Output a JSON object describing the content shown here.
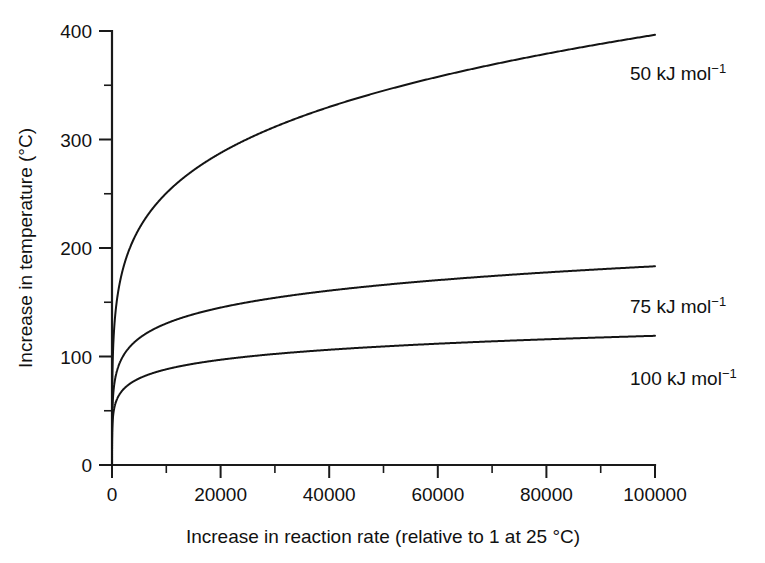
{
  "figure": {
    "background_color": "#ffffff",
    "line_color": "#141414",
    "axis_color": "#1a1a1a"
  },
  "axes": {
    "x_title": "Increase in reaction rate (relative to 1 at 25 °C)",
    "y_title": "Increase in temperature (°C)",
    "x_ticks": [
      "0",
      "20000",
      "40000",
      "60000",
      "80000",
      "100000"
    ],
    "y_ticks": [
      "0",
      "100",
      "200",
      "300",
      "400"
    ]
  },
  "series_labels": {
    "s50_base": "50 kJ mol",
    "s50_sup": "−1",
    "s75_base": "75 kJ mol",
    "s75_sup": "−1",
    "s100_base": "100 kJ mol",
    "s100_sup": "−1"
  },
  "chart_data": {
    "type": "line",
    "title": "",
    "xlabel": "Increase in reaction rate (relative to 1 at 25 °C)",
    "ylabel": "Increase in temperature (°C)",
    "xlim": [
      0,
      100000
    ],
    "ylim": [
      0,
      400
    ],
    "xticks": [
      0,
      20000,
      40000,
      60000,
      80000,
      100000
    ],
    "yticks": [
      0,
      100,
      200,
      300,
      400
    ],
    "x_minor_tick_interval": 10000,
    "y_minor_tick_interval": 50,
    "grid": false,
    "legend": "inline-right-of-curve-ends",
    "annotations": [
      {
        "text": "50 kJ mol⁻¹",
        "x": 100000,
        "y": 355,
        "series": "50 kJ mol-1"
      },
      {
        "text": "75 kJ mol⁻¹",
        "x": 100000,
        "y": 160,
        "series": "75 kJ mol-1"
      },
      {
        "text": "100 kJ mol⁻¹",
        "x": 100000,
        "y": 95,
        "series": "100 kJ mol-1"
      }
    ],
    "series": [
      {
        "name": "50 kJ mol-1",
        "activation_energy_kJ_per_mol": 50,
        "x": [
          0,
          1,
          10,
          50,
          100,
          250,
          500,
          1000,
          2000,
          4000,
          6000,
          8000,
          10000,
          15000,
          20000,
          25000,
          30000,
          35000,
          40000,
          45000,
          50000,
          55000,
          60000,
          65000,
          70000,
          75000,
          80000,
          85000,
          90000,
          95000,
          100000
        ],
        "y": [
          0,
          38,
          95,
          140,
          163,
          193,
          216,
          240,
          263,
          287,
          301,
          311,
          319,
          334,
          344,
          352,
          359,
          364,
          369,
          373,
          377,
          380,
          383,
          386,
          389,
          391,
          393,
          395,
          397,
          399,
          400
        ]
      },
      {
        "name": "75 kJ mol-1",
        "activation_energy_kJ_per_mol": 75,
        "x": [
          0,
          1,
          10,
          50,
          100,
          250,
          500,
          1000,
          2000,
          4000,
          6000,
          8000,
          10000,
          15000,
          20000,
          25000,
          30000,
          35000,
          40000,
          45000,
          50000,
          55000,
          60000,
          65000,
          70000,
          75000,
          80000,
          85000,
          90000,
          95000,
          100000
        ],
        "y": [
          0,
          28,
          62,
          88,
          100,
          115,
          126,
          137,
          147,
          157,
          163,
          167,
          170,
          176,
          181,
          184,
          187,
          189,
          191,
          193,
          194,
          196,
          197,
          198,
          199,
          200,
          201,
          202,
          203,
          204,
          205
        ]
      },
      {
        "name": "100 kJ mol-1",
        "activation_energy_kJ_per_mol": 100,
        "x": [
          0,
          1,
          10,
          50,
          100,
          250,
          500,
          1000,
          2000,
          4000,
          6000,
          8000,
          10000,
          15000,
          20000,
          25000,
          30000,
          35000,
          40000,
          45000,
          50000,
          55000,
          60000,
          65000,
          70000,
          75000,
          80000,
          85000,
          90000,
          95000,
          100000
        ],
        "y": [
          0,
          22,
          47,
          66,
          75,
          86,
          93,
          101,
          108,
          115,
          119,
          122,
          125,
          129,
          132,
          135,
          137,
          138,
          140,
          141,
          142,
          143,
          144,
          145,
          146,
          147,
          148,
          148,
          149,
          150,
          150
        ]
      }
    ]
  }
}
